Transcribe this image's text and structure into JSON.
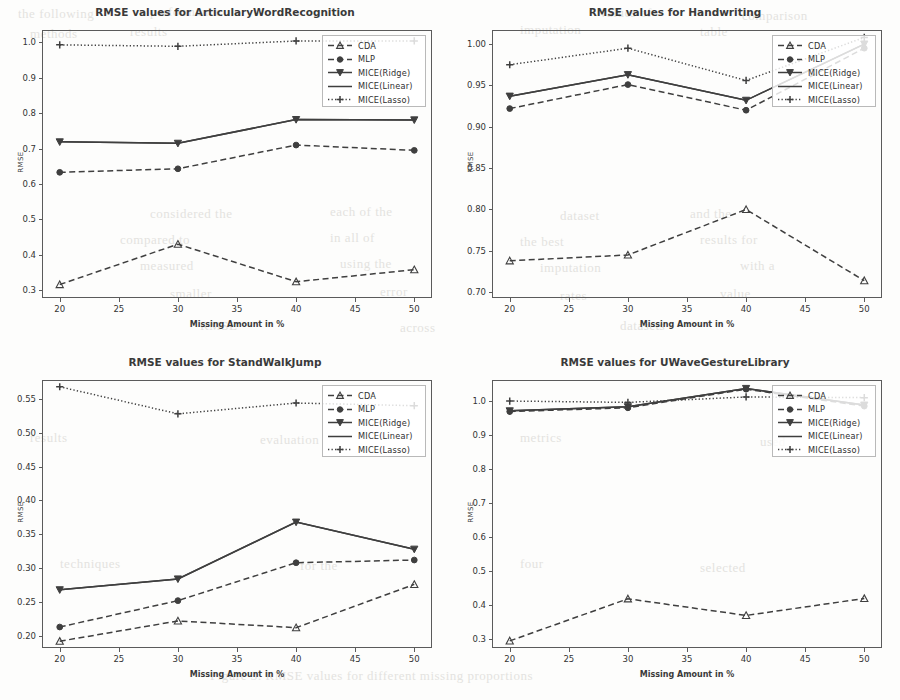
{
  "page": {
    "bleed_text": [
      {
        "t": "the following",
        "x": 18,
        "y": 6
      },
      {
        "t": "performance",
        "x": 150,
        "y": 4
      },
      {
        "t": "values of",
        "x": 600,
        "y": 5
      },
      {
        "t": "comparison",
        "x": 742,
        "y": 8
      },
      {
        "t": "methods",
        "x": 30,
        "y": 26
      },
      {
        "t": "results",
        "x": 130,
        "y": 24
      },
      {
        "t": "imputation",
        "x": 520,
        "y": 22
      },
      {
        "t": "table",
        "x": 700,
        "y": 24
      },
      {
        "t": "considered the",
        "x": 150,
        "y": 206
      },
      {
        "t": "each of the",
        "x": 330,
        "y": 204
      },
      {
        "t": "dataset",
        "x": 560,
        "y": 208
      },
      {
        "t": "and the",
        "x": 690,
        "y": 206
      },
      {
        "t": "compared to",
        "x": 120,
        "y": 232
      },
      {
        "t": "in all of",
        "x": 330,
        "y": 230
      },
      {
        "t": "the best",
        "x": 520,
        "y": 234
      },
      {
        "t": "results for",
        "x": 700,
        "y": 232
      },
      {
        "t": "measured",
        "x": 140,
        "y": 258
      },
      {
        "t": "using the",
        "x": 340,
        "y": 256
      },
      {
        "t": "imputation",
        "x": 540,
        "y": 260
      },
      {
        "t": "with a",
        "x": 740,
        "y": 258
      },
      {
        "t": "smaller",
        "x": 170,
        "y": 286
      },
      {
        "t": "error",
        "x": 380,
        "y": 284
      },
      {
        "t": "rates",
        "x": 560,
        "y": 288
      },
      {
        "t": "value",
        "x": 720,
        "y": 286
      },
      {
        "t": "RMSE",
        "x": 200,
        "y": 318
      },
      {
        "t": "across",
        "x": 400,
        "y": 320
      },
      {
        "t": "datasets",
        "x": 620,
        "y": 318
      },
      {
        "t": "results",
        "x": 30,
        "y": 430
      },
      {
        "t": "evaluation",
        "x": 260,
        "y": 432
      },
      {
        "t": "metrics",
        "x": 520,
        "y": 430
      },
      {
        "t": "used",
        "x": 760,
        "y": 434
      },
      {
        "t": "techniques",
        "x": 60,
        "y": 556
      },
      {
        "t": "for the",
        "x": 300,
        "y": 558
      },
      {
        "t": "four",
        "x": 520,
        "y": 556
      },
      {
        "t": "selected",
        "x": 700,
        "y": 560
      },
      {
        "t": "Figure 3: RMSE values for different missing proportions",
        "x": 210,
        "y": 668
      }
    ]
  },
  "axes_common": {
    "xlabel": "Missing Amount in %",
    "ylabel": "RMSE",
    "xticks": [
      "20",
      "25",
      "30",
      "35",
      "40",
      "45",
      "50"
    ],
    "xtick_values": [
      20,
      25,
      30,
      35,
      40,
      45,
      50
    ],
    "xlim": [
      18.5,
      51.5
    ]
  },
  "legend": {
    "entries": [
      {
        "label": "CDA",
        "style": "dashed-marker",
        "marker": "triangle-up"
      },
      {
        "label": "MLP",
        "style": "dashed-marker",
        "marker": "circle"
      },
      {
        "label": "MICE(Ridge)",
        "style": "solid-marker",
        "marker": "triangle-down"
      },
      {
        "label": "MICE(Linear)",
        "style": "solid",
        "marker": "none"
      },
      {
        "label": "MICE(Lasso)",
        "style": "dotted-marker",
        "marker": "plus"
      }
    ]
  },
  "colors": {
    "line": "#3f3f3f",
    "frame": "#5b5b5b",
    "text": "#333333",
    "legend_border": "#b9b9b9",
    "page_bg": "#fdfdfc",
    "bleed": "#cfcdc9"
  },
  "chart_data": [
    {
      "type": "line",
      "title": "RMSE values for ArticularyWordRecognition",
      "xlabel": "Missing Amount in %",
      "ylabel": "RMSE",
      "x": [
        20,
        30,
        40,
        50
      ],
      "ylim": [
        0.278,
        1.035
      ],
      "yticks": [
        0.3,
        0.4,
        0.5,
        0.6,
        0.7,
        0.8,
        0.9,
        1.0
      ],
      "ytick_labels": [
        "0.3",
        "0.4",
        "0.5",
        "0.6",
        "0.7",
        "0.8",
        "0.9",
        "1.0"
      ],
      "grid": false,
      "legend_position": "upper right",
      "series": [
        {
          "name": "CDA",
          "values": [
            0.316,
            0.43,
            0.324,
            0.358
          ]
        },
        {
          "name": "MLP",
          "values": [
            0.633,
            0.643,
            0.71,
            0.695
          ]
        },
        {
          "name": "MICE(Ridge)",
          "values": [
            0.719,
            0.715,
            0.782,
            0.781
          ]
        },
        {
          "name": "MICE(Linear)",
          "values": [
            0.719,
            0.715,
            0.782,
            0.781
          ]
        },
        {
          "name": "MICE(Lasso)",
          "values": [
            0.993,
            0.989,
            1.004,
            1.004
          ]
        }
      ]
    },
    {
      "type": "line",
      "title": "RMSE values for Handwriting",
      "xlabel": "Missing Amount in %",
      "ylabel": "RMSE",
      "x": [
        20,
        30,
        40,
        50
      ],
      "ylim": [
        0.693,
        1.017
      ],
      "yticks": [
        0.7,
        0.75,
        0.8,
        0.85,
        0.9,
        0.95,
        1.0
      ],
      "ytick_labels": [
        "0.70",
        "0.75",
        "0.80",
        "0.85",
        "0.90",
        "0.95",
        "1.00"
      ],
      "grid": false,
      "legend_position": "upper right",
      "series": [
        {
          "name": "CDA",
          "values": [
            0.738,
            0.745,
            0.8,
            0.714
          ]
        },
        {
          "name": "MLP",
          "values": [
            0.922,
            0.951,
            0.92,
            0.995
          ]
        },
        {
          "name": "MICE(Ridge)",
          "values": [
            0.937,
            0.963,
            0.932,
            1.0
          ]
        },
        {
          "name": "MICE(Linear)",
          "values": [
            0.937,
            0.963,
            0.932,
            1.0
          ]
        },
        {
          "name": "MICE(Lasso)",
          "values": [
            0.975,
            0.995,
            0.956,
            1.008
          ]
        }
      ]
    },
    {
      "type": "line",
      "title": "RMSE values for StandWalkJump",
      "xlabel": "Missing Amount in %",
      "ylabel": "RMSE",
      "x": [
        20,
        30,
        40,
        50
      ],
      "ylim": [
        0.182,
        0.578
      ],
      "yticks": [
        0.2,
        0.25,
        0.3,
        0.35,
        0.4,
        0.45,
        0.5,
        0.55
      ],
      "ytick_labels": [
        "0.20",
        "0.25",
        "0.30",
        "0.35",
        "0.40",
        "0.45",
        "0.50",
        "0.55"
      ],
      "grid": false,
      "legend_position": "upper right",
      "series": [
        {
          "name": "CDA",
          "values": [
            0.192,
            0.222,
            0.212,
            0.276
          ]
        },
        {
          "name": "MLP",
          "values": [
            0.213,
            0.252,
            0.308,
            0.312
          ]
        },
        {
          "name": "MICE(Ridge)",
          "values": [
            0.268,
            0.284,
            0.368,
            0.328
          ]
        },
        {
          "name": "MICE(Linear)",
          "values": [
            0.268,
            0.284,
            0.368,
            0.328
          ]
        },
        {
          "name": "MICE(Lasso)",
          "values": [
            0.568,
            0.528,
            0.544,
            0.54
          ]
        }
      ]
    },
    {
      "type": "line",
      "title": "RMSE values for UWaveGestureLibrary",
      "xlabel": "Missing Amount in %",
      "ylabel": "RMSE",
      "x": [
        20,
        30,
        40,
        50
      ],
      "ylim": [
        0.272,
        1.062
      ],
      "yticks": [
        0.3,
        0.4,
        0.5,
        0.6,
        0.7,
        0.8,
        0.9,
        1.0
      ],
      "ytick_labels": [
        "0.3",
        "0.4",
        "0.5",
        "0.6",
        "0.7",
        "0.8",
        "0.9",
        "1.0"
      ],
      "grid": false,
      "legend_position": "upper right",
      "series": [
        {
          "name": "CDA",
          "values": [
            0.293,
            0.417,
            0.368,
            0.418
          ]
        },
        {
          "name": "MLP",
          "values": [
            0.969,
            0.98,
            1.035,
            0.985
          ]
        },
        {
          "name": "MICE(Ridge)",
          "values": [
            0.971,
            0.983,
            1.037,
            0.988
          ]
        },
        {
          "name": "MICE(Linear)",
          "values": [
            0.971,
            0.983,
            1.037,
            0.988
          ]
        },
        {
          "name": "MICE(Lasso)",
          "values": [
            1.0,
            0.996,
            1.012,
            1.01
          ]
        }
      ]
    }
  ]
}
